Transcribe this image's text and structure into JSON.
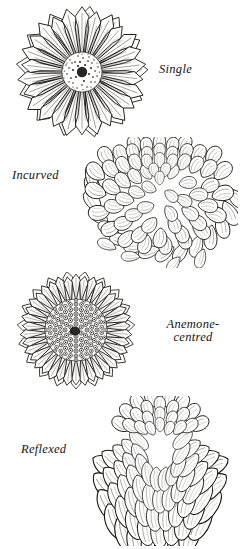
{
  "plate": {
    "title": "Chrysanthemum flower forms",
    "background_color": "#ffffff",
    "ink_color": "#15120f",
    "width": 240,
    "height": 549
  },
  "figures": [
    {
      "id": "single",
      "label": "Single",
      "form": "single",
      "description": "Daisy-like bloom with one or few rows of flat pointed ray petals around a dense stippled central disc",
      "petal_count": 26,
      "center_type": "stippled-disc",
      "label_position": "right"
    },
    {
      "id": "incurved",
      "label": "Incurved",
      "form": "incurved",
      "description": "Dense globular bloom of broad petals curving upward and inward to form a tight dome, with lower petals hanging loose",
      "petal_count": 64,
      "center_type": "closed-dome",
      "label_position": "left"
    },
    {
      "id": "anemone",
      "label_line_1": "Anemone-",
      "label_line_2": "centred",
      "label": "Anemone-centred",
      "form": "anemone-centred",
      "description": "Flat ring of narrow ray petals surrounding a large raised cushion of tubular disc florets",
      "petal_count": 38,
      "center_type": "raised-floret-cushion",
      "label_position": "right"
    },
    {
      "id": "reflexed",
      "label": "Reflexed",
      "form": "reflexed",
      "description": "Rounded bloom whose overlapping petals curve downward and outward from a raised crown",
      "petal_count": 70,
      "center_type": "raised-crown",
      "label_position": "left"
    }
  ]
}
